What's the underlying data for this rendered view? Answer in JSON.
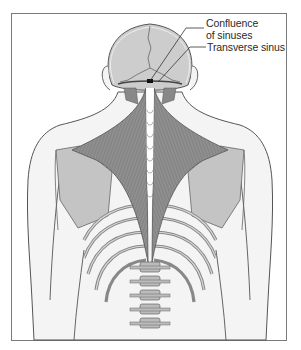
{
  "figure": {
    "labels": [
      {
        "id": "confluence",
        "lines": [
          "Confluence",
          "of sinuses"
        ]
      },
      {
        "id": "transverse",
        "lines": [
          "Transverse sinus"
        ]
      }
    ],
    "colors": {
      "frame": "#7a7a7a",
      "muscle": "#8f8f8f",
      "muscle_dark": "#6e6e6e",
      "bone": "#c4c4c4",
      "skull": "#cdcdcd",
      "skin_outline": "#555555",
      "body_fill": "#f2f2f2",
      "sinus_marker": "#111111"
    }
  }
}
